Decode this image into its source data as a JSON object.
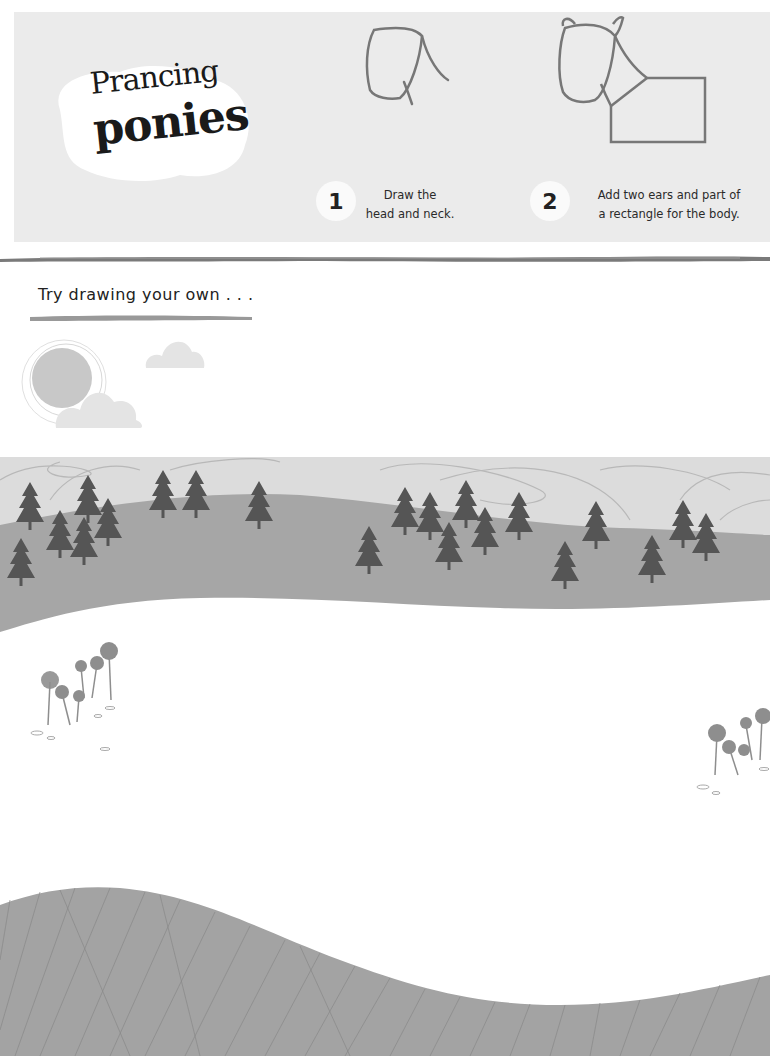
{
  "header": {
    "title_line1": "Prancing",
    "title_line2": "ponies"
  },
  "steps": [
    {
      "number": "1",
      "text_line1": "Draw the",
      "text_line2": "head and neck."
    },
    {
      "number": "2",
      "text_line1": "Add two ears and part of",
      "text_line2": "a rectangle for the body."
    }
  ],
  "practice": {
    "prompt": "Try drawing your own . . ."
  },
  "colors": {
    "panel": "#ebebeb",
    "sky": "#dcdcdc",
    "hill": "#a6a6a6",
    "tree": "#555555",
    "ground": "#a3a3a3",
    "cloud": "#e4e4e4",
    "sun": "#c8c8c8",
    "flower": "#8e8e8e"
  },
  "illustration": {
    "trees": 22,
    "flower_clusters": 2,
    "clouds": 2,
    "sun": 1
  }
}
